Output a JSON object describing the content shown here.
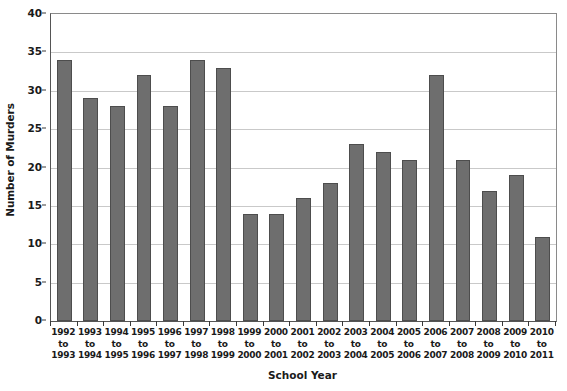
{
  "chart_data": {
    "type": "bar",
    "title": "",
    "xlabel": "School Year",
    "ylabel": "Number of Murders",
    "ylim": [
      0,
      40
    ],
    "ytick_step": 5,
    "yticks": [
      "0",
      "5",
      "10",
      "15",
      "20",
      "25",
      "30",
      "35",
      "40"
    ],
    "grid": true,
    "legend": false,
    "bar_color": "#6e6e6e",
    "bar_edge_color": "#4d4d4d",
    "categories": [
      "1992 to 1993",
      "1993 to 1994",
      "1994 to 1995",
      "1995 to 1996",
      "1996 to 1997",
      "1997 to 1998",
      "1998 to 1999",
      "1999 to 2000",
      "2000 to 2001",
      "2001 to 2002",
      "2002 to 2003",
      "2003 to 2004",
      "2004 to 2005",
      "2005 to 2006",
      "2006 to 2007",
      "2007 to 2008",
      "2008 to 2009",
      "2009 to 2010",
      "2010 to 2011"
    ],
    "category_lines": [
      [
        "1992",
        "to",
        "1993"
      ],
      [
        "1993",
        "to",
        "1994"
      ],
      [
        "1994",
        "to",
        "1995"
      ],
      [
        "1995",
        "to",
        "1996"
      ],
      [
        "1996",
        "to",
        "1997"
      ],
      [
        "1997",
        "to",
        "1998"
      ],
      [
        "1998",
        "to",
        "1999"
      ],
      [
        "1999",
        "to",
        "2000"
      ],
      [
        "2000",
        "to",
        "2001"
      ],
      [
        "2001",
        "to",
        "2002"
      ],
      [
        "2002",
        "to",
        "2003"
      ],
      [
        "2003",
        "to",
        "2004"
      ],
      [
        "2004",
        "to",
        "2005"
      ],
      [
        "2005",
        "to",
        "2006"
      ],
      [
        "2006",
        "to",
        "2007"
      ],
      [
        "2007",
        "to",
        "2008"
      ],
      [
        "2008",
        "to",
        "2009"
      ],
      [
        "2009",
        "to",
        "2010"
      ],
      [
        "2010",
        "to",
        "2011"
      ]
    ],
    "values": [
      34,
      29,
      28,
      32,
      28,
      34,
      33,
      14,
      14,
      16,
      18,
      23,
      22,
      21,
      32,
      21,
      17,
      19,
      11
    ]
  }
}
